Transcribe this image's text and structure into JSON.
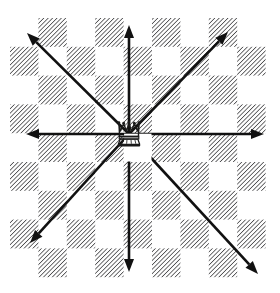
{
  "figure": {
    "background_color": "#ffffff",
    "width": 280,
    "height": 293
  },
  "board": {
    "name": "chessboard",
    "origin_x": 10,
    "origin_y": 18,
    "cell_width": 28.4,
    "cell_height": 28.8,
    "columns": 9,
    "rows": 9,
    "dark_square_fill": "#58585a",
    "dark_square_pattern": "diagonal-hatch",
    "light_square_fill": "#ffffff",
    "hatch_angle_deg": 45,
    "hatch_spacing": 2.2,
    "hatch_line_width": 1.1,
    "pattern_description": "Dark squares are rendered as 45 degree diagonal hatch lines on white",
    "dark_squares": [
      [
        0,
        1
      ],
      [
        0,
        3
      ],
      [
        0,
        5
      ],
      [
        0,
        7
      ],
      [
        1,
        0
      ],
      [
        1,
        2
      ],
      [
        1,
        4
      ],
      [
        1,
        6
      ],
      [
        1,
        8
      ],
      [
        2,
        1
      ],
      [
        2,
        3
      ],
      [
        2,
        5
      ],
      [
        2,
        7
      ],
      [
        3,
        0
      ],
      [
        3,
        2
      ],
      [
        3,
        4
      ],
      [
        3,
        6
      ],
      [
        3,
        8
      ],
      [
        4,
        1
      ],
      [
        4,
        3
      ],
      [
        4,
        5
      ],
      [
        4,
        7
      ],
      [
        5,
        0
      ],
      [
        5,
        2
      ],
      [
        5,
        4
      ],
      [
        5,
        6
      ],
      [
        5,
        8
      ],
      [
        6,
        1
      ],
      [
        6,
        3
      ],
      [
        6,
        5
      ],
      [
        6,
        7
      ],
      [
        7,
        0
      ],
      [
        7,
        2
      ],
      [
        7,
        4
      ],
      [
        7,
        6
      ],
      [
        7,
        8
      ],
      [
        8,
        1
      ],
      [
        8,
        3
      ],
      [
        8,
        5
      ],
      [
        8,
        7
      ]
    ]
  },
  "queen": {
    "name": "queen-piece",
    "label": "Queen",
    "square_row": 4,
    "square_col": 4,
    "center_x": 129,
    "center_y": 134,
    "icon": "chess-queen-crown",
    "color": "#1a1a1a",
    "crown_points": 5
  },
  "arrows": {
    "color": "#111111",
    "shaft_width": 2.6,
    "head_length": 13,
    "head_width": 10,
    "origin_x": 129,
    "origin_y": 134,
    "directions": [
      {
        "name": "north",
        "label": "Up",
        "dx": 0,
        "dy": -1,
        "tip_x": 129,
        "tip_y": 25
      },
      {
        "name": "northeast",
        "label": "Up-Right",
        "dx": 1,
        "dy": -1,
        "tip_x": 228,
        "tip_y": 32
      },
      {
        "name": "east",
        "label": "Right",
        "dx": 1,
        "dy": 0,
        "tip_x": 264,
        "tip_y": 134
      },
      {
        "name": "southeast",
        "label": "Down-Right",
        "dx": 1,
        "dy": 1,
        "tip_x": 258,
        "tip_y": 274
      },
      {
        "name": "south",
        "label": "Down",
        "dx": 0,
        "dy": 1,
        "tip_x": 129,
        "tip_y": 272
      },
      {
        "name": "southwest",
        "label": "Down-Left",
        "dx": -1,
        "dy": 1,
        "tip_x": 30,
        "tip_y": 243
      },
      {
        "name": "west",
        "label": "Left",
        "dx": -1,
        "dy": 0,
        "tip_x": 26,
        "tip_y": 134
      },
      {
        "name": "northwest",
        "label": "Up-Left",
        "dx": -1,
        "dy": -1,
        "tip_x": 27,
        "tip_y": 33
      }
    ]
  }
}
